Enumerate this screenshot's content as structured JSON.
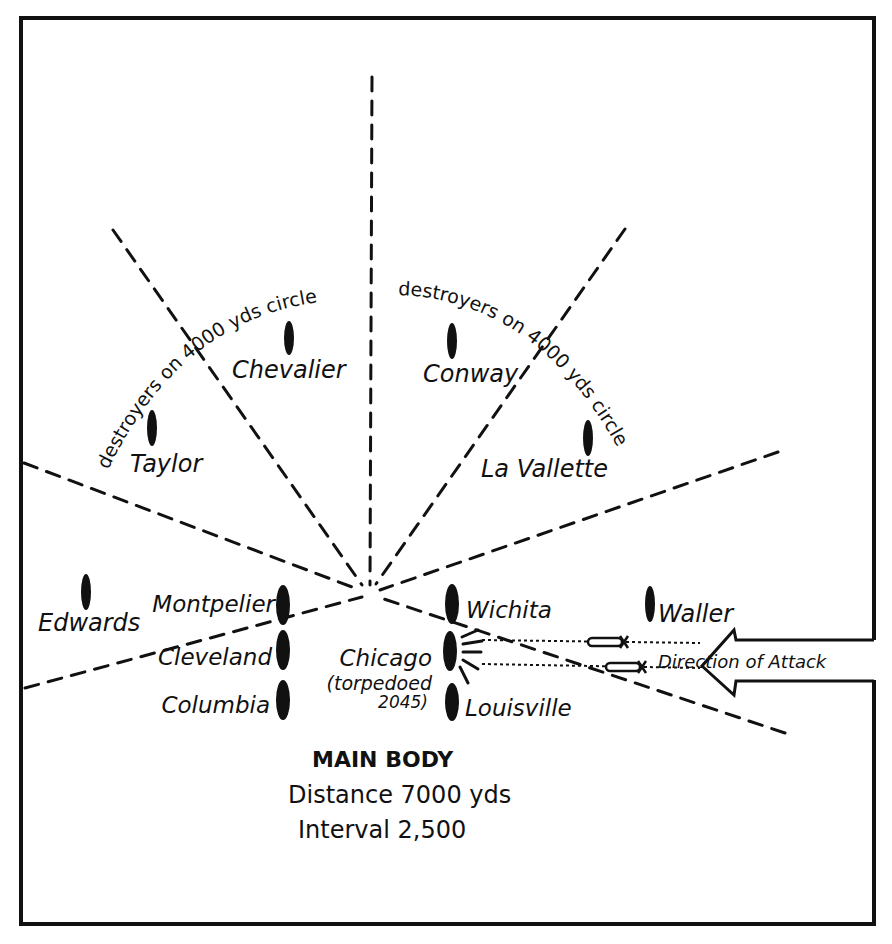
{
  "diagram": {
    "title": "Main Body",
    "caption_lines": [
      "MAIN BODY",
      "Distance 7000 yds",
      "Interval 2,500"
    ],
    "arc_labels": {
      "left": "destroyers on 4000 yds circle",
      "right": "destroyers on 4000 yds circle"
    },
    "destroyers": [
      {
        "name": "Taylor",
        "x": 152,
        "y": 428
      },
      {
        "name": "Chevalier",
        "x": 289,
        "y": 338
      },
      {
        "name": "Conway",
        "x": 452,
        "y": 341
      },
      {
        "name": "La Vallette",
        "x": 588,
        "y": 438
      },
      {
        "name": "Edwards",
        "x": 86,
        "y": 592
      },
      {
        "name": "Waller",
        "x": 650,
        "y": 604
      }
    ],
    "main_body_ships": [
      {
        "name": "Montpelier",
        "x": 283,
        "y": 605
      },
      {
        "name": "Cleveland",
        "x": 283,
        "y": 650
      },
      {
        "name": "Columbia",
        "x": 283,
        "y": 700
      },
      {
        "name": "Wichita",
        "x": 452,
        "y": 604
      },
      {
        "name": "Chicago",
        "x": 450,
        "y": 651
      },
      {
        "name": "Louisville",
        "x": 452,
        "y": 702
      }
    ],
    "chicago_note_line1": "(torpedoed",
    "chicago_note_line2": "2045)",
    "arrow_label": "Direction of Attack",
    "colors": {
      "ink": "#111111",
      "paper": "#ffffff"
    }
  }
}
